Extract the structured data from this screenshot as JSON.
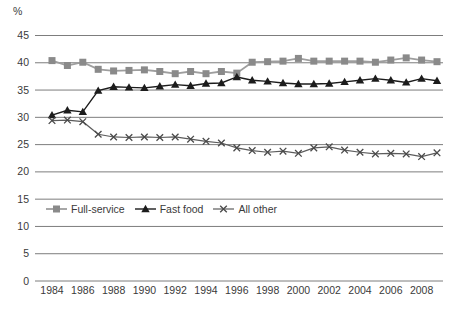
{
  "page": {
    "background": "#ffffff"
  },
  "chart_data": {
    "type": "line",
    "title": "",
    "ylabel": "%",
    "xlabel": "",
    "ylim": [
      0,
      45
    ],
    "yticks": [
      45,
      40,
      35,
      30,
      25,
      20,
      15,
      10,
      5,
      0
    ],
    "grid": "horizontal",
    "legend_position": "inside-left-lower",
    "axis_color": "#7d7d7d",
    "text_color": "#3a3a3a",
    "x": [
      1984,
      1985,
      1986,
      1987,
      1988,
      1989,
      1990,
      1991,
      1992,
      1993,
      1994,
      1995,
      1996,
      1997,
      1998,
      1999,
      2000,
      2001,
      2002,
      2003,
      2004,
      2005,
      2006,
      2007,
      2008,
      2009
    ],
    "xtick_labels": [
      "1984",
      "1986",
      "1988",
      "1990",
      "1992",
      "1994",
      "1996",
      "1998",
      "2000",
      "2002",
      "2004",
      "2006",
      "2008"
    ],
    "series": [
      {
        "name": "Full-service",
        "marker": "square",
        "marker_color": "#8a8a8a",
        "line_color": "#9e9e9e",
        "line_width": 1.8,
        "values": [
          40.4,
          39.5,
          40.1,
          38.8,
          38.5,
          38.6,
          38.7,
          38.4,
          38.0,
          38.4,
          38.0,
          38.4,
          38.1,
          40.1,
          40.2,
          40.3,
          40.8,
          40.3,
          40.3,
          40.3,
          40.3,
          40.1,
          40.5,
          40.9,
          40.5,
          40.2
        ]
      },
      {
        "name": "Fast food",
        "marker": "triangle",
        "marker_color": "#1c1c1c",
        "line_color": "#1c1c1c",
        "line_width": 1.4,
        "values": [
          30.4,
          31.3,
          31.0,
          34.9,
          35.6,
          35.5,
          35.4,
          35.7,
          36.0,
          35.8,
          36.2,
          36.3,
          37.4,
          36.8,
          36.6,
          36.3,
          36.1,
          36.1,
          36.2,
          36.5,
          36.8,
          37.1,
          36.8,
          36.4,
          37.1,
          36.7
        ]
      },
      {
        "name": "All other",
        "marker": "x",
        "marker_color": "#4a4a4a",
        "line_color": "#5c5c5c",
        "line_width": 1.2,
        "values": [
          29.4,
          29.5,
          29.2,
          26.9,
          26.4,
          26.3,
          26.4,
          26.3,
          26.4,
          26.0,
          25.6,
          25.3,
          24.4,
          23.9,
          23.6,
          23.8,
          23.4,
          24.4,
          24.6,
          24.0,
          23.6,
          23.3,
          23.4,
          23.3,
          22.8,
          23.5
        ]
      }
    ]
  }
}
